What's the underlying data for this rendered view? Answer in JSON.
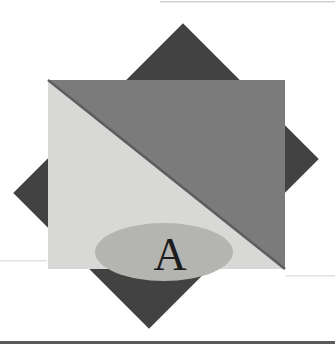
{
  "figure": {
    "label": "A",
    "colors": {
      "background": "#ffffff",
      "diamond": "#424242",
      "upper_triangle": "#7b7b7b",
      "lower_triangle": "#d8d8d6",
      "diagonal_edge": "#5d5d5d",
      "ellipse": "#b4b4b1",
      "label": "#1c1c1c",
      "bottom_rule": "#5a5a5a",
      "top_rule": "#d0d0d0",
      "faint_line": "#e4e1df"
    }
  }
}
